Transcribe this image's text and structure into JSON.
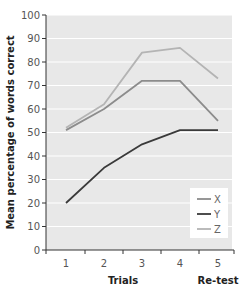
{
  "chart_data": {
    "type": "line",
    "title": "",
    "xlabel": "Trials",
    "xlabel_secondary": "Re-test",
    "ylabel": "Mean percentage of words correct",
    "categories": [
      "1",
      "2",
      "3",
      "4",
      "5"
    ],
    "ylim": [
      0,
      100
    ],
    "yticks": [
      0,
      10,
      20,
      30,
      40,
      50,
      60,
      70,
      80,
      90,
      100
    ],
    "grid": true,
    "legend_position": "lower right",
    "series": [
      {
        "name": "X",
        "color": "#8c8c8c",
        "values": [
          51,
          60,
          72,
          72,
          55
        ]
      },
      {
        "name": "Y",
        "color": "#3a3a3a",
        "values": [
          20,
          35,
          45,
          51,
          51
        ]
      },
      {
        "name": "Z",
        "color": "#b4b4b4",
        "values": [
          52,
          62,
          84,
          86,
          73
        ]
      }
    ]
  },
  "colors": {
    "plot_background": "#e8e8e8",
    "gridline": "#ffffff",
    "axis": "#333333"
  }
}
